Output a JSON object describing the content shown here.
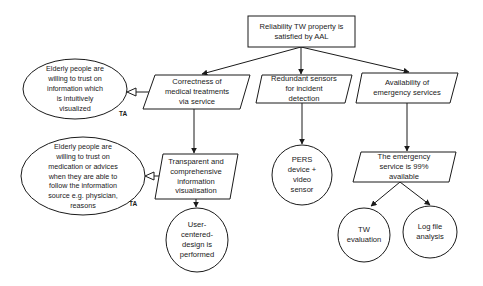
{
  "diagram": {
    "type": "goal-structure",
    "root": {
      "id": "goal",
      "text": "Reliability TW property is\nsatisfied by AAL"
    },
    "strategies": [
      {
        "id": "strategy-correctness",
        "text": "Correctness of\nmedical treatments\nvia service"
      },
      {
        "id": "strategy-redundant-sensors",
        "text": "Redundant sensors\nfor incident\ndetection"
      },
      {
        "id": "strategy-availability",
        "text": "Availability of\nemergency services"
      }
    ],
    "sub_claims": [
      {
        "id": "claim-transparent",
        "text": "Transparent and\ncomprehensive\ninformation\nvisualisation"
      },
      {
        "id": "claim-emergency-99",
        "text": "The emergency\nservice is 99%\navailable"
      }
    ],
    "assumptions": [
      {
        "id": "assumption-intuitive",
        "text": "Elderly people are\nwilling to trust on\ninformation which\nis intuitively\nvisualized",
        "tag": "TA"
      },
      {
        "id": "assumption-source",
        "text": "Elderly people are\nwilling to trust on\nmedication or advices\nwhen they are able to\nfollow the information\nsource e.g. physician,\nreasons",
        "tag": "TA"
      }
    ],
    "evidence": [
      {
        "id": "evidence-ucd",
        "text": "User-\ncentered-\ndesign is\nperformed"
      },
      {
        "id": "evidence-pers",
        "text": "PERS\ndevice +\nvideo\nsensor"
      },
      {
        "id": "evidence-tw-eval",
        "text": "TW\nevaluation"
      },
      {
        "id": "evidence-log",
        "text": "Log file\nanalysis"
      }
    ],
    "edges": [
      {
        "from": "goal",
        "to": "strategy-correctness",
        "type": "supported-by"
      },
      {
        "from": "goal",
        "to": "strategy-redundant-sensors",
        "type": "supported-by"
      },
      {
        "from": "goal",
        "to": "strategy-availability",
        "type": "supported-by"
      },
      {
        "from": "strategy-correctness",
        "to": "assumption-intuitive",
        "type": "in-context-of"
      },
      {
        "from": "strategy-correctness",
        "to": "claim-transparent",
        "type": "supported-by"
      },
      {
        "from": "claim-transparent",
        "to": "assumption-source",
        "type": "in-context-of"
      },
      {
        "from": "claim-transparent",
        "to": "evidence-ucd",
        "type": "supported-by"
      },
      {
        "from": "strategy-redundant-sensors",
        "to": "evidence-pers",
        "type": "supported-by"
      },
      {
        "from": "strategy-availability",
        "to": "claim-emergency-99",
        "type": "supported-by"
      },
      {
        "from": "claim-emergency-99",
        "to": "evidence-tw-eval",
        "type": "supported-by"
      },
      {
        "from": "claim-emergency-99",
        "to": "evidence-log",
        "type": "supported-by"
      }
    ]
  }
}
